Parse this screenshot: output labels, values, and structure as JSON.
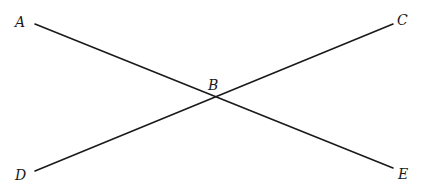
{
  "diagram": {
    "type": "intersecting-lines",
    "points": {
      "A": {
        "label": "A",
        "x": 35,
        "y": 24,
        "lx": 15,
        "ly": 27
      },
      "B": {
        "label": "B",
        "x": 213,
        "y": 97,
        "lx": 208,
        "ly": 90
      },
      "C": {
        "label": "C",
        "x": 393,
        "y": 24,
        "lx": 397,
        "ly": 25
      },
      "D": {
        "label": "D",
        "x": 35,
        "y": 171,
        "lx": 15,
        "ly": 180
      },
      "E": {
        "label": "E",
        "x": 393,
        "y": 168,
        "lx": 398,
        "ly": 179
      }
    },
    "segments": [
      {
        "from": "A",
        "to": "E"
      },
      {
        "from": "D",
        "to": "C"
      }
    ],
    "stroke_color": "#1a1a1a"
  }
}
